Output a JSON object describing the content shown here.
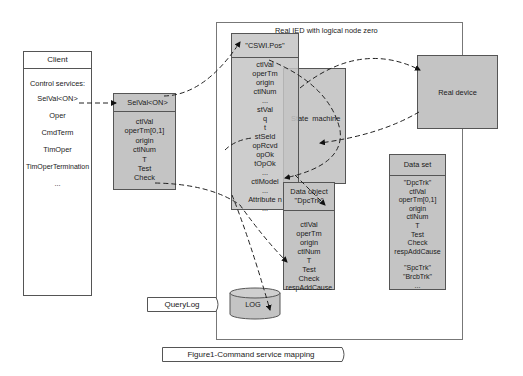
{
  "figure": {
    "caption": "Figure1-Command service mapping"
  },
  "client": {
    "title": "Client",
    "services_label": "Control services:",
    "services": [
      "SelVal<ON>",
      "Oper",
      "CmdTerm",
      "TimOper",
      "TimOperTermination",
      "..."
    ]
  },
  "selval_box": {
    "title": "SelVal<ON>",
    "attributes": [
      "ctlVal",
      "operTm[0,1]",
      "origin",
      "ctlNum",
      "T",
      "Test",
      "Check"
    ]
  },
  "ied": {
    "title": "Real IED with logical node zero"
  },
  "cswi_box": {
    "title": "\"CSWI.Pos\"",
    "attributes": [
      "ctlVal",
      "operTm",
      "origin",
      "ctlNum",
      "...",
      "stVal",
      "q",
      "t",
      "stSeld",
      "opRcvd",
      "opOk",
      "tOpOk",
      "...",
      "ctlModel",
      "...",
      "Attribute n",
      "..."
    ]
  },
  "state_machine": {
    "label": "State  machine"
  },
  "real_device": {
    "label": "Real device"
  },
  "data_object": {
    "title_line1": "Data object",
    "title_line2": "\"DpcTrk\"",
    "attributes": [
      "ctlVal",
      "operTm",
      "origin",
      "ctlNum",
      "T",
      "Test",
      "Check",
      "respAddCause"
    ]
  },
  "data_set": {
    "title": "Data set",
    "members": [
      "\"DpcTrk\"",
      "ctlVal",
      "operTm[0,1]",
      "origin",
      "ctlNum",
      "T",
      "Test",
      "Check",
      "respAddCause",
      "",
      "\"SpcTrk\"",
      "\"BrcbTrk\"",
      "..."
    ]
  },
  "log": {
    "label": "LOG"
  },
  "query_log": {
    "label": "QueryLog"
  },
  "colors": {
    "box_fill": "#c4c4c4",
    "line": "#555555",
    "dash": "#222222"
  }
}
